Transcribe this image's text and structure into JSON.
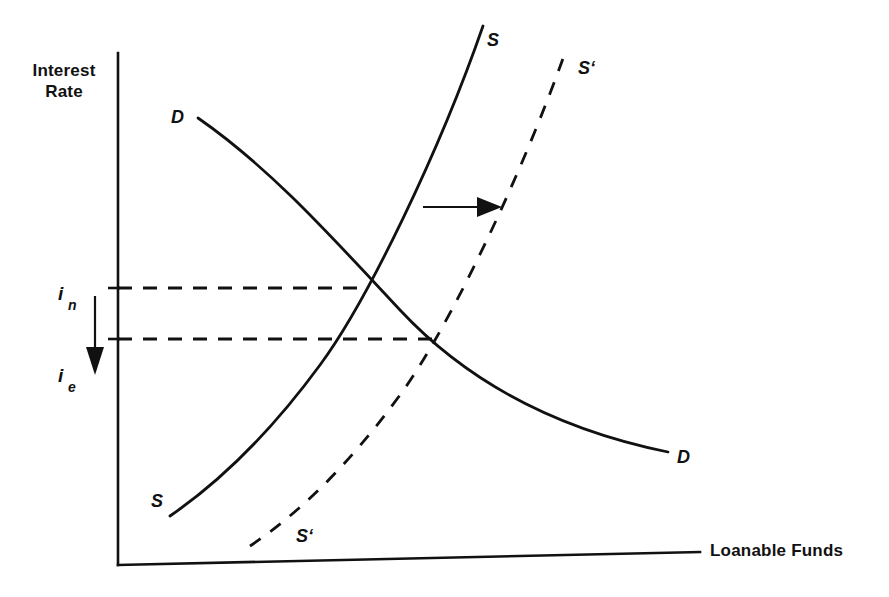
{
  "figure": {
    "kind": "economics-diagram",
    "title_visible": false,
    "background_color": "#ffffff",
    "ink_color": "#111111"
  },
  "axes": {
    "y_axis_label_line1": "Interest",
    "y_axis_label_line2": "Rate",
    "x_axis_label": "Loanable Funds",
    "y_axis": {
      "x": 118,
      "y_top": 53,
      "y_bottom": 565
    },
    "x_axis": {
      "x_left": 118,
      "y_left": 565,
      "x_right": 700,
      "y_right": 552
    }
  },
  "rate_labels": [
    {
      "id": "i-nominal",
      "base": "i",
      "subscript": "n",
      "x": 60,
      "y": 300,
      "level_y": 288
    },
    {
      "id": "i-equilibrium",
      "base": "i",
      "subscript": "e",
      "x": 60,
      "y": 382,
      "level_y": 339
    }
  ],
  "shift_arrows": [
    {
      "id": "rate-down-arrow",
      "direction": "down",
      "x1": 95,
      "y1": 296,
      "x2": 95,
      "y2": 357,
      "head": "100,372 88,348 102,348"
    },
    {
      "id": "supply-shift-right-arrow",
      "direction": "right",
      "x1": 423,
      "y1": 207,
      "x2": 482,
      "y2": 207,
      "head": "500,207 478,198 478,216"
    }
  ],
  "guide_lines": [
    {
      "id": "nominal-rate-guide",
      "x1": 118,
      "y1": 288,
      "x2": 364,
      "y2": 288,
      "tick_x1": 108,
      "tick_x2": 120
    },
    {
      "id": "equilibrium-rate-guide",
      "x1": 118,
      "y1": 339,
      "x2": 438,
      "y2": 339,
      "tick_x1": 108,
      "tick_x2": 120
    }
  ],
  "curves": [
    {
      "id": "demand-curve",
      "name": "D",
      "style": "solid",
      "path": "M 198 118 C 270 168, 330 235, 400 310 C 470 385, 560 430, 668 452"
    },
    {
      "id": "supply-curve",
      "name": "S",
      "style": "solid",
      "path": "M 170 516 C 215 485, 265 440, 320 365 C 368 300, 440 150, 483 26"
    },
    {
      "id": "supply-curve-shifted",
      "name": "S'",
      "style": "dashed",
      "path": "M 250 546 C 295 516, 345 470, 400 395 C 448 330, 522 175, 566 50"
    }
  ],
  "curve_labels": [
    {
      "id": "demand-label-top",
      "text": "D",
      "x": 171,
      "y": 123
    },
    {
      "id": "demand-label-bottom",
      "text": "D",
      "x": 677,
      "y": 463
    },
    {
      "id": "supply-label-top",
      "text": "S",
      "x": 487,
      "y": 46
    },
    {
      "id": "supply-label-bottom",
      "text": "S",
      "x": 151,
      "y": 507
    },
    {
      "id": "supply-shift-label-top",
      "text": "S‘",
      "x": 578,
      "y": 74
    },
    {
      "id": "supply-shift-label-bottom",
      "text": "S‘",
      "x": 296,
      "y": 542
    }
  ],
  "chart_data": {
    "type": "line",
    "title": "",
    "xlabel": "Loanable Funds",
    "ylabel": "Interest Rate",
    "grid": false,
    "legend": "none",
    "annotations": [
      "Supply shifts right from S to S'",
      "Interest rate falls from i_n to i_e"
    ],
    "series": [
      {
        "name": "D",
        "style": "solid",
        "description": "Downward sloping demand for loanable funds"
      },
      {
        "name": "S",
        "style": "solid",
        "description": "Upward sloping supply of loanable funds"
      },
      {
        "name": "S'",
        "style": "dashed",
        "description": "Supply of loanable funds after rightward shift"
      }
    ],
    "equilibria": [
      {
        "label": "i_n",
        "rate_level": "nominal",
        "curves": [
          "S",
          "D"
        ]
      },
      {
        "label": "i_e",
        "rate_level": "equilibrium",
        "curves": [
          "S'",
          "D"
        ]
      }
    ]
  }
}
